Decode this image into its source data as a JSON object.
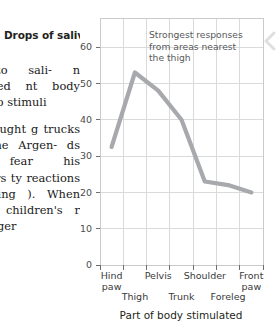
{
  "article": {
    "column_heading": "Drops of saliva",
    "paragraphs": [
      "ned to sali- n scratched nt body part e to stimuli",
      "dlers taught g trucks and One Argen- ds with fear his torturers ty reactions comparing ). When an ed children's r and longer"
    ]
  },
  "chart_data": {
    "type": "line",
    "title": "Drops of saliva",
    "xlabel": "Part of body stimulated",
    "ylabel": "Drops of saliva",
    "categories": [
      "Hind paw",
      "Thigh",
      "Pelvis",
      "Trunk",
      "Shoulder",
      "Foreleg",
      "Front paw"
    ],
    "category_rows": [
      {
        "label": "Hind paw",
        "row": "top",
        "lines": [
          "Hind",
          "paw"
        ]
      },
      {
        "label": "Thigh",
        "row": "bottom",
        "lines": [
          "Thigh"
        ]
      },
      {
        "label": "Pelvis",
        "row": "top",
        "lines": [
          "Pelvis"
        ]
      },
      {
        "label": "Trunk",
        "row": "bottom",
        "lines": [
          "Trunk"
        ]
      },
      {
        "label": "Shoulder",
        "row": "top",
        "lines": [
          "Shoulder"
        ]
      },
      {
        "label": "Foreleg",
        "row": "bottom",
        "lines": [
          "Foreleg"
        ]
      },
      {
        "label": "Front paw",
        "row": "top",
        "lines": [
          "Front",
          "paw"
        ]
      }
    ],
    "values": [
      32.5,
      53,
      48,
      40,
      23,
      22,
      20
    ],
    "yticks": [
      0,
      10,
      20,
      30,
      40,
      50,
      60
    ],
    "ylim": [
      0,
      68
    ],
    "grid": true,
    "legend": "none",
    "line_color": "#a7a9ac",
    "grid_color": "#d9dadb",
    "annotations": [
      {
        "name": "peak-annotation",
        "lines": [
          "Strongest responses",
          "from areas nearest",
          "the thigh"
        ]
      }
    ]
  },
  "decoration": {
    "right_chevron": "chevron-left-icon"
  }
}
